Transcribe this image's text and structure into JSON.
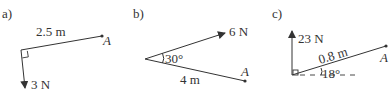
{
  "panels": [
    {
      "label": "a)",
      "distance_label": "2.5 m",
      "force_label": "3 N",
      "point_label": "A",
      "right_angle": true
    },
    {
      "label": "b)",
      "force_label": "6 N",
      "angle_label": "30°",
      "distance_label": "4 m",
      "point_label": "A"
    },
    {
      "label": "c)",
      "force_label": "23 N",
      "distance_label": "0.8 m",
      "angle_label": "18°",
      "point_label": "A",
      "right_angle": true
    }
  ],
  "colors": {
    "ink": "#333333"
  }
}
